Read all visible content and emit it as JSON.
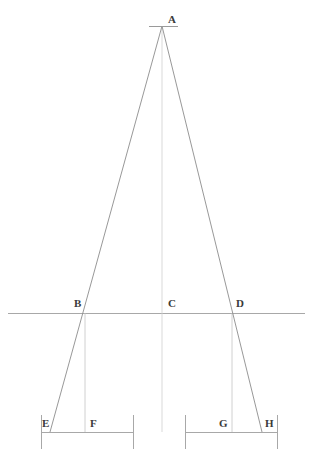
{
  "canvas": {
    "width": 317,
    "height": 455,
    "background": "#ffffff"
  },
  "style": {
    "ray_color": "#8c8c8c",
    "axis_color": "#b0b0b0",
    "baseline_color": "#a8a8a8",
    "dimension_color": "#9a9a9a",
    "label_color": "#3a3a3a",
    "ray_width": 0.9,
    "axis_width": 0.8,
    "baseline_width": 1.0
  },
  "chart_data": {
    "type": "diagram",
    "title": "",
    "points": [
      {
        "id": "A",
        "label": "A",
        "x": 162,
        "y": 26,
        "label_x": 168,
        "label_y": 14
      },
      {
        "id": "B",
        "label": "B",
        "x": 85,
        "y": 313,
        "label_x": 74,
        "label_y": 298
      },
      {
        "id": "C",
        "label": "C",
        "x": 162,
        "y": 313,
        "label_x": 168,
        "label_y": 298
      },
      {
        "id": "D",
        "label": "D",
        "x": 232,
        "y": 313,
        "label_x": 236,
        "label_y": 298
      },
      {
        "id": "E",
        "label": "E",
        "x": 50,
        "y": 432,
        "label_x": 42,
        "label_y": 418
      },
      {
        "id": "F",
        "label": "F",
        "x": 85,
        "y": 432,
        "label_x": 90,
        "label_y": 418
      },
      {
        "id": "G",
        "label": "G",
        "x": 232,
        "y": 432,
        "label_x": 219,
        "label_y": 418
      },
      {
        "id": "H",
        "label": "H",
        "x": 262,
        "y": 432,
        "label_x": 265,
        "label_y": 418
      }
    ],
    "segments": [
      {
        "name": "apex-tick",
        "x1": 149,
        "y1": 26,
        "x2": 178,
        "y2": 26
      },
      {
        "name": "ray-left-A-to-E",
        "x1": 162,
        "y1": 26,
        "x2": 50,
        "y2": 432
      },
      {
        "name": "ray-right-A-to-H",
        "x1": 162,
        "y1": 26,
        "x2": 262,
        "y2": 432
      },
      {
        "name": "axis-A-to-C",
        "x1": 162,
        "y1": 26,
        "x2": 162,
        "y2": 432
      },
      {
        "name": "drop-B-to-F",
        "x1": 85,
        "y1": 313,
        "x2": 85,
        "y2": 432
      },
      {
        "name": "drop-D-to-G",
        "x1": 232,
        "y1": 313,
        "x2": 232,
        "y2": 432
      },
      {
        "name": "reference-line",
        "x1": 8,
        "y1": 313,
        "x2": 305,
        "y2": 313
      }
    ],
    "dimension_lines": [
      {
        "name": "dimension-left",
        "x1": 41,
        "x2": 133,
        "y": 432,
        "tick_up": 17,
        "tick_down": 17
      },
      {
        "name": "dimension-right",
        "x1": 185,
        "x2": 277,
        "y": 432,
        "tick_up": 17,
        "tick_down": 17
      }
    ]
  }
}
